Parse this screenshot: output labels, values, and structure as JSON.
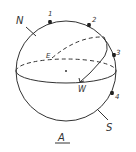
{
  "diagram": {
    "title": "A",
    "labels": {
      "north": "N",
      "south": "S",
      "east": "E",
      "west": "W"
    },
    "stars": [
      {
        "label": "1"
      },
      {
        "label": "2"
      },
      {
        "label": "3"
      },
      {
        "label": "4"
      }
    ],
    "colors": {
      "line": "#333333",
      "background": "#ffffff"
    }
  }
}
